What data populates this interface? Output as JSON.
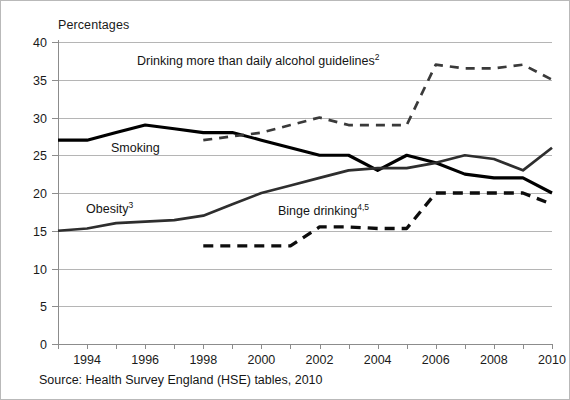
{
  "figure": {
    "title": "Percentages",
    "source_note": "Source: Health Survey England (HSE) tables, 2010"
  },
  "labels": {
    "smoking": "Smoking",
    "obesity": "Obesity",
    "obesity_sup": "3",
    "alcohol": "Drinking more than daily alcohol guidelines",
    "alcohol_sup": "2",
    "binge": "Binge drinking",
    "binge_sup": "4,5"
  },
  "chart_data": {
    "type": "line",
    "title": "Percentages",
    "xlabel": "",
    "ylabel": "Percentages",
    "xlim": [
      1993,
      2010
    ],
    "ylim": [
      0,
      40
    ],
    "ytick_values": [
      0,
      5,
      10,
      15,
      20,
      25,
      30,
      35,
      40
    ],
    "ytick_labels": [
      "0",
      "5",
      "10",
      "15",
      "20",
      "25",
      "30",
      "35",
      "40"
    ],
    "xtick_values": [
      1994,
      1996,
      1998,
      2000,
      2002,
      2004,
      2006,
      2008,
      2010
    ],
    "xtick_labels": [
      "1994",
      "1996",
      "1998",
      "2000",
      "2002",
      "2004",
      "2006",
      "2008",
      "2010"
    ],
    "x_minor_ticks": [
      1993,
      1994,
      1995,
      1996,
      1997,
      1998,
      1999,
      2000,
      2001,
      2002,
      2003,
      2004,
      2005,
      2006,
      2007,
      2008,
      2009,
      2010
    ],
    "grid": "horizontal",
    "legend": "inline-annotations",
    "series": [
      {
        "name": "Smoking",
        "style": "solid",
        "color": "#000000",
        "x": [
          1993,
          1994,
          1995,
          1996,
          1997,
          1998,
          1999,
          2000,
          2001,
          2002,
          2003,
          2004,
          2005,
          2006,
          2007,
          2008,
          2009,
          2010
        ],
        "values": [
          27,
          27,
          28,
          29,
          28.5,
          28,
          28,
          27,
          26,
          25,
          25,
          23,
          25,
          24,
          22.5,
          22,
          22,
          20
        ]
      },
      {
        "name": "Obesity",
        "style": "solid",
        "color": "#2e2e2e",
        "x": [
          1993,
          1994,
          1995,
          1996,
          1997,
          1998,
          1999,
          2000,
          2001,
          2002,
          2003,
          2004,
          2005,
          2006,
          2007,
          2008,
          2009,
          2010
        ],
        "values": [
          15,
          15.3,
          16,
          16.2,
          16.4,
          17,
          18.5,
          20,
          21,
          22,
          23,
          23.3,
          23.3,
          24,
          25,
          24.5,
          23,
          26
        ]
      },
      {
        "name": "Drinking more than daily alcohol guidelines",
        "style": "dashed",
        "color": "#3a3a3a",
        "x": [
          1998,
          1999,
          2000,
          2001,
          2002,
          2003,
          2004,
          2005,
          2006,
          2007,
          2008,
          2009,
          2010
        ],
        "values": [
          27,
          27.5,
          28,
          29,
          30,
          29,
          29,
          29,
          37,
          36.5,
          36.5,
          37,
          35
        ]
      },
      {
        "name": "Binge drinking",
        "style": "dashed",
        "color": "#0d0d0d",
        "x": [
          1998,
          1999,
          2000,
          2001,
          2002,
          2003,
          2004,
          2005,
          2006,
          2007,
          2008,
          2009,
          2010
        ],
        "values": [
          13,
          13,
          13,
          13,
          15.5,
          15.5,
          15.3,
          15.3,
          20,
          20,
          20,
          20,
          18.5
        ]
      }
    ]
  }
}
